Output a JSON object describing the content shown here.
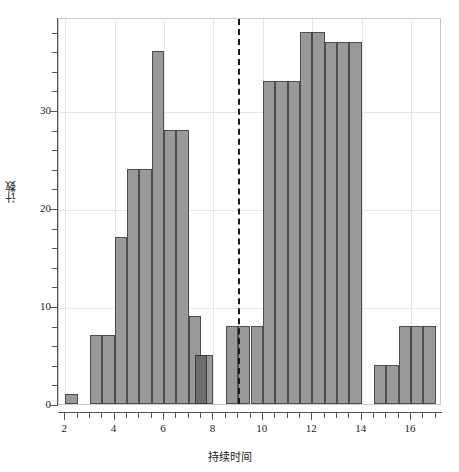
{
  "chart_data": {
    "type": "bar",
    "title": "",
    "subtitle": "",
    "xlabel": "持续时间",
    "ylabel": "计数",
    "xlim": [
      1.75,
      17.25
    ],
    "ylim": [
      0,
      39.5
    ],
    "grid": true,
    "legend": null,
    "bin_width": 0.5,
    "x_ticks": [
      2,
      4,
      6,
      8,
      10,
      12,
      14,
      16
    ],
    "x_tick_labels": [
      "2",
      "4",
      "6",
      "8",
      "10",
      "12",
      "14",
      "16"
    ],
    "x_minor_ticks": [
      2.5,
      3,
      3.5,
      4.5,
      5,
      5.5,
      6.5,
      7,
      7.5,
      8.5,
      9,
      9.5,
      10.5,
      11,
      11.5,
      12.5,
      13,
      13.5,
      14.5,
      15,
      15.5,
      16.5,
      17
    ],
    "y_ticks": [
      0,
      10,
      20,
      30
    ],
    "y_tick_labels": [
      "0",
      "10",
      "20",
      "30"
    ],
    "y_minor_ticks": [
      2,
      4,
      6,
      8,
      12,
      14,
      16,
      18,
      22,
      24,
      26,
      28,
      32,
      34,
      36,
      38
    ],
    "bars": [
      {
        "bin_start": 2.0,
        "bin_end": 2.5,
        "value": 1,
        "highlight": false
      },
      {
        "bin_start": 2.5,
        "bin_end": 3.0,
        "value": 0,
        "highlight": false
      },
      {
        "bin_start": 3.0,
        "bin_end": 3.5,
        "value": 7,
        "highlight": false
      },
      {
        "bin_start": 3.5,
        "bin_end": 4.0,
        "value": 7,
        "highlight": false
      },
      {
        "bin_start": 4.0,
        "bin_end": 4.5,
        "value": 17,
        "highlight": false
      },
      {
        "bin_start": 4.5,
        "bin_end": 5.0,
        "value": 24,
        "highlight": false
      },
      {
        "bin_start": 5.0,
        "bin_end": 5.5,
        "value": 24,
        "highlight": false
      },
      {
        "bin_start": 5.5,
        "bin_end": 6.0,
        "value": 36,
        "highlight": false
      },
      {
        "bin_start": 6.0,
        "bin_end": 6.5,
        "value": 28,
        "highlight": false
      },
      {
        "bin_start": 6.5,
        "bin_end": 7.0,
        "value": 28,
        "highlight": false
      },
      {
        "bin_start": 7.0,
        "bin_end": 7.5,
        "value": 9,
        "highlight": false
      },
      {
        "bin_start": 7.25,
        "bin_end": 7.75,
        "value": 5,
        "highlight": true
      },
      {
        "bin_start": 7.5,
        "bin_end": 8.0,
        "value": 5,
        "highlight": false
      },
      {
        "bin_start": 8.5,
        "bin_end": 9.0,
        "value": 8,
        "highlight": false
      },
      {
        "bin_start": 9.0,
        "bin_end": 9.5,
        "value": 8,
        "highlight": false
      },
      {
        "bin_start": 9.5,
        "bin_end": 10.0,
        "value": 8,
        "highlight": false
      },
      {
        "bin_start": 10.0,
        "bin_end": 10.5,
        "value": 33,
        "highlight": false
      },
      {
        "bin_start": 10.5,
        "bin_end": 11.0,
        "value": 33,
        "highlight": false
      },
      {
        "bin_start": 11.0,
        "bin_end": 11.5,
        "value": 33,
        "highlight": false
      },
      {
        "bin_start": 11.5,
        "bin_end": 12.0,
        "value": 38,
        "highlight": false
      },
      {
        "bin_start": 12.0,
        "bin_end": 12.5,
        "value": 38,
        "highlight": false
      },
      {
        "bin_start": 12.5,
        "bin_end": 13.0,
        "value": 37,
        "highlight": false
      },
      {
        "bin_start": 13.0,
        "bin_end": 13.5,
        "value": 37,
        "highlight": false
      },
      {
        "bin_start": 13.5,
        "bin_end": 14.0,
        "value": 37,
        "highlight": false
      },
      {
        "bin_start": 14.5,
        "bin_end": 15.0,
        "value": 4,
        "highlight": false
      },
      {
        "bin_start": 15.0,
        "bin_end": 15.5,
        "value": 4,
        "highlight": false
      },
      {
        "bin_start": 15.5,
        "bin_end": 16.0,
        "value": 8,
        "highlight": false
      },
      {
        "bin_start": 16.0,
        "bin_end": 16.5,
        "value": 8,
        "highlight": false
      },
      {
        "bin_start": 16.5,
        "bin_end": 17.0,
        "value": 8,
        "highlight": false
      }
    ],
    "reference_line": {
      "orientation": "vertical",
      "x": 9,
      "style": "dashed",
      "color": "#1a1a1a"
    },
    "colors": {
      "bar_fill": "#999999",
      "bar_edge": "#4d4d4d",
      "highlight_fill": "#6e6e6e",
      "highlight_edge": "#3a3a3a",
      "grid": "#e6e6e6",
      "axis": "#555555",
      "text": "#1a1a1a",
      "background": "#ffffff"
    }
  }
}
